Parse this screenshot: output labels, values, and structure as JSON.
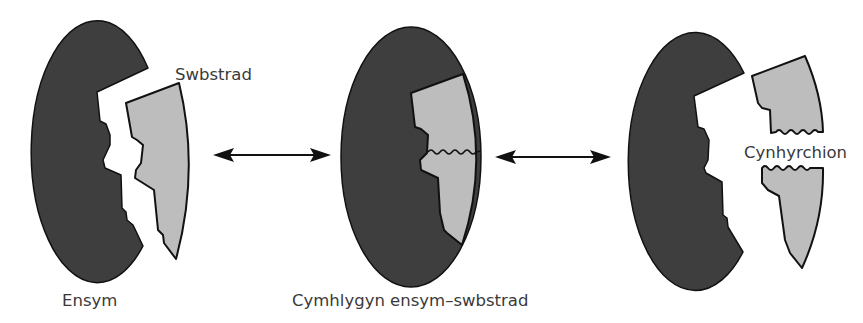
{
  "diagram": {
    "labels": {
      "enzyme": "Ensym",
      "substrate": "Swbstrad",
      "complex": "Cymhlygyn ensym–swbstrad",
      "products": "Cynhyrchion"
    },
    "stages": [
      {
        "name": "enzyme-and-substrate",
        "caption": "Ensym",
        "extra_label": "Swbstrad"
      },
      {
        "name": "enzyme-substrate-complex",
        "caption": "Cymhlygyn ensym–swbstrad"
      },
      {
        "name": "enzyme-and-products",
        "extra_label": "Cynhyrchion"
      }
    ],
    "arrows": [
      {
        "from": "enzyme-and-substrate",
        "to": "enzyme-substrate-complex",
        "type": "double-headed"
      },
      {
        "from": "enzyme-substrate-complex",
        "to": "enzyme-and-products",
        "type": "double-headed"
      }
    ],
    "colors": {
      "enzyme": "#3e3e3e",
      "substrate": "#bdbdbd",
      "outline": "#111111",
      "text": "#3a3a3a",
      "background": "#ffffff"
    }
  }
}
